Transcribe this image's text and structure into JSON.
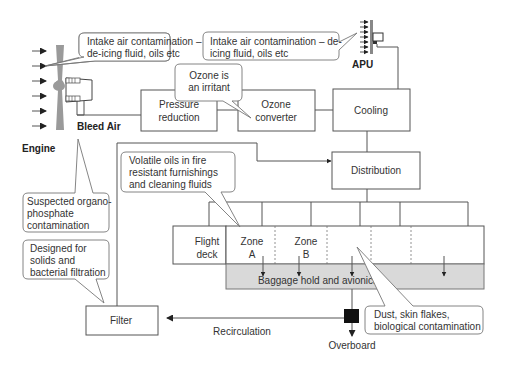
{
  "diagram": {
    "engine": {
      "label": "Engine",
      "bleed_label": "Bleed Air"
    },
    "apu": {
      "label": "APU"
    },
    "boxes": {
      "pressure_reduction": [
        "Pressure",
        "reduction"
      ],
      "ozone_converter": [
        "Ozone",
        "converter"
      ],
      "cooling": "Cooling",
      "distribution": "Distribution",
      "filter": "Filter",
      "flight_deck": [
        "Flight",
        "deck"
      ],
      "zone_a": [
        "Zone",
        "A"
      ],
      "zone_b": [
        "Zone",
        "B"
      ],
      "baggage_hold": "Baggage hold and avionics"
    },
    "flow_labels": {
      "recirculation": "Recirculation",
      "overboard": "Overboard"
    },
    "callouts": {
      "engine_intake": [
        "Intake air contamination –",
        "de-icing fluid, oils etc"
      ],
      "apu_intake": [
        "Intake air contamination – de-",
        "icing fluid, oils etc"
      ],
      "ozone": [
        "Ozone is",
        "an irritant"
      ],
      "volatile_oils": [
        "Volatile oils in fire",
        "resistant  furnishings",
        "and cleaning fluids"
      ],
      "organophosphate": [
        "Suspected organo-",
        "phosphate",
        "contamination"
      ],
      "filter_design": [
        "Designed for",
        "solids and",
        "bacterial filtration"
      ],
      "dust": [
        "Dust, skin flakes,",
        "biological contamination"
      ]
    },
    "colors": {
      "line": "#555555",
      "hold_fill": "#d9d9d9",
      "engine_fill": "#999999",
      "valve_fill": "#111111"
    }
  }
}
